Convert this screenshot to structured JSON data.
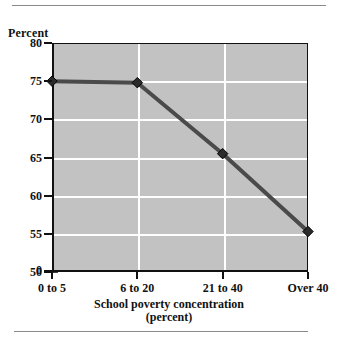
{
  "figure": {
    "y_axis_caption": "Percent",
    "x_axis_caption_line1": "School poverty concentration",
    "x_axis_caption_line2": "(percent)"
  },
  "chart_data": {
    "type": "line",
    "title": "",
    "subtitle": "",
    "xlabel": "School poverty concentration (percent)",
    "ylabel": "Percent",
    "categories": [
      "0 to 5",
      "6 to 20",
      "21 to 40",
      "Over 40"
    ],
    "values": [
      75.0,
      74.8,
      65.5,
      55.3
    ],
    "series": [
      {
        "name": "Percent",
        "values": [
          75.0,
          74.8,
          65.5,
          55.3
        ]
      }
    ],
    "ylim": [
      50,
      80
    ],
    "yticks": [
      80,
      75,
      70,
      65,
      60,
      55,
      50
    ],
    "ytick_labels": [
      "80",
      "75",
      "70",
      "65",
      "60",
      "55",
      "50"
    ],
    "zero_tick_label": "0",
    "axis_break": true,
    "axis_break_between": [
      0,
      50
    ],
    "xtick_labels": [
      "0 to 5",
      "6 to 20",
      "21 to 40",
      "Over 40"
    ],
    "grid": true,
    "grid_color": "#ffffff",
    "plot_background": "#c2c2c2",
    "line_color": "#4a4a4a",
    "marker": "diamond",
    "marker_color": "#2b2b2b",
    "legend": "none"
  }
}
